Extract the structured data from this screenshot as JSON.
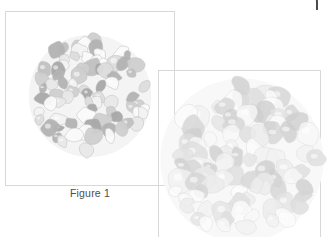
{
  "window": {
    "chrome_bar": "window-top-edge",
    "chrome_color": "#4a4a4a"
  },
  "figures": [
    {
      "id": "figure-1",
      "caption": "Figure 1",
      "frame": {
        "x": 5,
        "y": 11,
        "w": 170,
        "h": 175
      },
      "border_color": "#d8d8d8",
      "image": {
        "name": "cell-cluster-micrograph-1",
        "description": "dense roughly circular cluster of rounded cell-like shapes in light grays",
        "cx": 62,
        "cy": 62,
        "r": 60,
        "cell_count": 78,
        "palette": [
          "#f2f2f2",
          "#e8e8e8",
          "#dcdcdc",
          "#cfcfcf",
          "#c0c0c0",
          "#b2b2b2",
          "#a8a8a8",
          "#fafafa"
        ],
        "stroke": "#bdbdbd",
        "halo_color": "#f4f4f4"
      }
    },
    {
      "id": "figure-2",
      "caption": "",
      "frame": {
        "x": 158,
        "y": 70,
        "w": 163,
        "h": 180
      },
      "border_color": "#d8d8d8",
      "image": {
        "name": "cell-cluster-micrograph-2",
        "description": "larger, fainter circular cluster of rounded cell-like shapes, cropped at the bottom edge",
        "cx": 80,
        "cy": 84,
        "r": 80,
        "cell_count": 92,
        "palette": [
          "#f7f7f7",
          "#f1f1f1",
          "#ebebeb",
          "#e4e4e4",
          "#dddddd",
          "#d5d5d5",
          "#cecece",
          "#fbfbfb"
        ],
        "stroke": "#dadada",
        "halo_color": "#f8f8f8"
      }
    }
  ],
  "chart_data": {
    "type": "scatter",
    "title": "Figure 1",
    "xlabel": "",
    "ylabel": "",
    "series": [
      {
        "name": "cluster-1-cells",
        "count": 78,
        "mean_radius": 7.0
      },
      {
        "name": "cluster-2-cells",
        "count": 92,
        "mean_radius": 9.5
      }
    ]
  }
}
